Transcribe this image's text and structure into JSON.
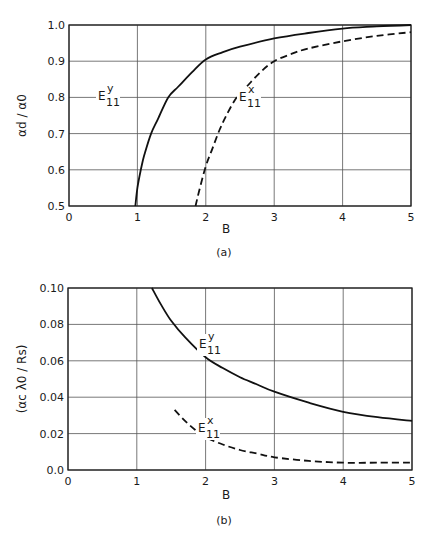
{
  "chart_data": [
    {
      "type": "line",
      "panel": "a",
      "caption": "(a)",
      "xlabel": "B",
      "ylabel": "αd / α0",
      "xlim": [
        0,
        5
      ],
      "ylim": [
        0.5,
        1.0
      ],
      "xticks": [
        "0",
        "1",
        "2",
        "3",
        "4",
        "5"
      ],
      "yticks": [
        "0.5",
        "0.6",
        "0.7",
        "0.8",
        "0.9",
        "1.0"
      ],
      "grid": true,
      "series": [
        {
          "name": "E11y",
          "label_main": "E",
          "label_sup": "y",
          "label_sub": "11",
          "style": "solid",
          "x": [
            0.97,
            1.0,
            1.05,
            1.1,
            1.2,
            1.3,
            1.45,
            1.6,
            1.8,
            2.0,
            2.25,
            2.5,
            3.0,
            3.5,
            4.0,
            4.5,
            5.0
          ],
          "y": [
            0.5,
            0.55,
            0.6,
            0.64,
            0.7,
            0.74,
            0.8,
            0.83,
            0.87,
            0.905,
            0.925,
            0.94,
            0.963,
            0.978,
            0.99,
            0.996,
            1.0
          ]
        },
        {
          "name": "E11x",
          "label_main": "E",
          "label_sup": "x",
          "label_sub": "11",
          "style": "dashed",
          "x": [
            1.85,
            1.9,
            2.0,
            2.1,
            2.2,
            2.3,
            2.45,
            2.6,
            2.8,
            3.0,
            3.25,
            3.5,
            4.0,
            4.5,
            5.0
          ],
          "y": [
            0.5,
            0.54,
            0.61,
            0.66,
            0.71,
            0.75,
            0.8,
            0.83,
            0.87,
            0.9,
            0.92,
            0.935,
            0.955,
            0.97,
            0.98
          ]
        }
      ]
    },
    {
      "type": "line",
      "panel": "b",
      "caption": "(b)",
      "xlabel": "B",
      "ylabel": "(αc λ0 / Rs)",
      "xlim": [
        0,
        5
      ],
      "ylim": [
        0.0,
        0.1
      ],
      "xticks": [
        "0",
        "1",
        "2",
        "3",
        "4",
        "5"
      ],
      "yticks": [
        "0.0",
        "0.02",
        "0.04",
        "0.06",
        "0.08",
        "0.10"
      ],
      "grid": true,
      "series": [
        {
          "name": "E11y",
          "label_main": "E",
          "label_sup": "y",
          "label_sub": "11",
          "style": "solid",
          "x": [
            1.22,
            1.35,
            1.5,
            1.7,
            2.0,
            2.25,
            2.5,
            2.75,
            3.0,
            3.5,
            4.0,
            4.5,
            5.0
          ],
          "y": [
            0.1,
            0.091,
            0.082,
            0.073,
            0.062,
            0.056,
            0.051,
            0.047,
            0.043,
            0.037,
            0.032,
            0.029,
            0.027
          ]
        },
        {
          "name": "E11x",
          "label_main": "E",
          "label_sup": "x",
          "label_sub": "11",
          "style": "dashed",
          "x": [
            1.55,
            1.7,
            1.85,
            2.0,
            2.25,
            2.5,
            2.75,
            3.0,
            3.5,
            4.0,
            4.5,
            5.0
          ],
          "y": [
            0.033,
            0.027,
            0.022,
            0.018,
            0.014,
            0.011,
            0.009,
            0.007,
            0.005,
            0.004,
            0.004,
            0.004
          ]
        }
      ]
    }
  ]
}
